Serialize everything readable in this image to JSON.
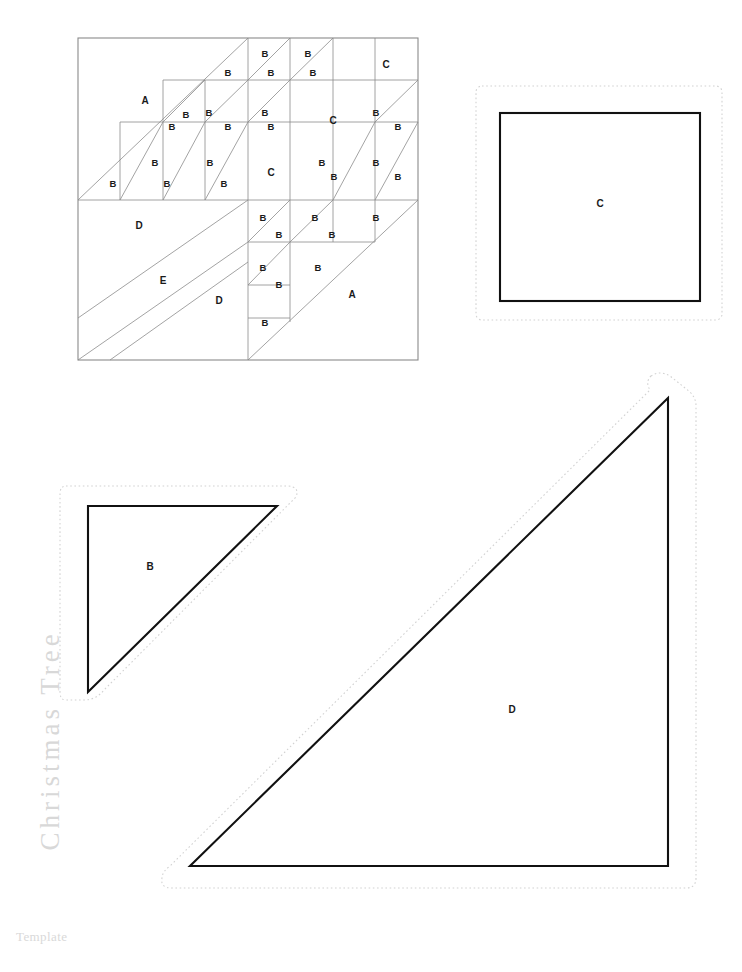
{
  "page": {
    "vertical_title": "Christmas Tree",
    "caption": "Template",
    "title_color": "#d8d8d8",
    "caption_color": "#d9d9d9",
    "line_color": "#8c8c8c",
    "cut_line_color": "#111111",
    "seam_allowance_color": "#d2d2d2",
    "background": "#ffffff"
  },
  "block_diagram": {
    "name": "christmas-tree-quilt-block",
    "x": 78,
    "y": 38,
    "size": 340,
    "grid": 8,
    "region_labels": [
      {
        "text": "A",
        "x": 145,
        "y": 101
      },
      {
        "text": "C",
        "x": 386,
        "y": 65
      },
      {
        "text": "C",
        "x": 333,
        "y": 121
      },
      {
        "text": "C",
        "x": 271,
        "y": 173
      },
      {
        "text": "D",
        "x": 139,
        "y": 226
      },
      {
        "text": "E",
        "x": 163,
        "y": 281
      },
      {
        "text": "D",
        "x": 219,
        "y": 301
      },
      {
        "text": "A",
        "x": 352,
        "y": 295
      }
    ],
    "hst_labels": [
      {
        "text": "B",
        "x": 228,
        "y": 73
      },
      {
        "text": "B",
        "x": 265,
        "y": 54
      },
      {
        "text": "B",
        "x": 271,
        "y": 73
      },
      {
        "text": "B",
        "x": 308,
        "y": 54
      },
      {
        "text": "B",
        "x": 313,
        "y": 73
      },
      {
        "text": "B",
        "x": 186,
        "y": 115
      },
      {
        "text": "B",
        "x": 172,
        "y": 127
      },
      {
        "text": "B",
        "x": 209,
        "y": 113
      },
      {
        "text": "B",
        "x": 228,
        "y": 127
      },
      {
        "text": "B",
        "x": 265,
        "y": 113
      },
      {
        "text": "B",
        "x": 271,
        "y": 127
      },
      {
        "text": "B",
        "x": 376,
        "y": 113
      },
      {
        "text": "B",
        "x": 398,
        "y": 127
      },
      {
        "text": "B",
        "x": 155,
        "y": 163
      },
      {
        "text": "B",
        "x": 113,
        "y": 184
      },
      {
        "text": "B",
        "x": 167,
        "y": 184
      },
      {
        "text": "B",
        "x": 210,
        "y": 163
      },
      {
        "text": "B",
        "x": 224,
        "y": 184
      },
      {
        "text": "B",
        "x": 322,
        "y": 163
      },
      {
        "text": "B",
        "x": 334,
        "y": 177
      },
      {
        "text": "B",
        "x": 376,
        "y": 163
      },
      {
        "text": "B",
        "x": 398,
        "y": 177
      },
      {
        "text": "B",
        "x": 263,
        "y": 218
      },
      {
        "text": "B",
        "x": 279,
        "y": 235
      },
      {
        "text": "B",
        "x": 315,
        "y": 218
      },
      {
        "text": "B",
        "x": 332,
        "y": 235
      },
      {
        "text": "B",
        "x": 376,
        "y": 218
      },
      {
        "text": "B",
        "x": 263,
        "y": 268
      },
      {
        "text": "B",
        "x": 279,
        "y": 285
      },
      {
        "text": "B",
        "x": 318,
        "y": 268
      },
      {
        "text": "B",
        "x": 265,
        "y": 323
      }
    ]
  },
  "templates": [
    {
      "id": "template-c-square",
      "label": "C",
      "shape": "square",
      "cut_line": {
        "x": 500,
        "y": 113,
        "width": 200,
        "height": 188
      },
      "seam_line": {
        "x": 476,
        "y": 86,
        "width": 246,
        "height": 234
      },
      "label_pos": {
        "x": 600,
        "y": 204
      }
    },
    {
      "id": "template-b-triangle",
      "label": "B",
      "shape": "right-triangle",
      "cut_points": "88,506 277,506 88,692",
      "seam_points": "64,484 296,484 296,506 110,692 88,714 64,714",
      "label_pos": {
        "x": 150,
        "y": 567
      }
    },
    {
      "id": "template-d-triangle",
      "label": "D",
      "shape": "right-triangle",
      "cut_points": "668,398 668,866 190,866",
      "seam_points": "645,374 696,374 696,890 178,890 160,868 645,382",
      "label_pos": {
        "x": 512,
        "y": 710
      }
    }
  ]
}
